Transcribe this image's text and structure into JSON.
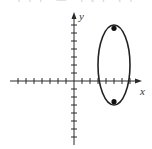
{
  "chart_data": {
    "type": "scatter",
    "title": "",
    "xlabel": "x",
    "ylabel": "y",
    "xlim": [
      -7,
      8
    ],
    "ylim": [
      -8,
      8.5
    ],
    "grid": false,
    "tick_spacing": 1,
    "tick_labels": false,
    "ellipse": {
      "center": [
        5,
        2
      ],
      "semi_axis_x": 2,
      "semi_axis_y": 5,
      "x_intercepts": [
        3,
        7
      ]
    },
    "points": [
      {
        "name": "focus-top",
        "x": 5,
        "y": 6.58
      },
      {
        "name": "focus-bottom",
        "x": 5,
        "y": -2.58
      }
    ],
    "legend": null
  },
  "labels": {
    "x_axis": "x",
    "y_axis": "y"
  },
  "clipped_header": "(1) — (y) (1) — 1 ·"
}
